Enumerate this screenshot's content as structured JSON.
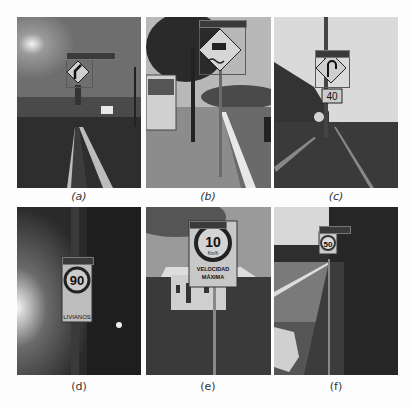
{
  "figure": {
    "panels": [
      {
        "id": "a",
        "caption": "(a)",
        "caption_style": "italic",
        "scene": "dusk highway with median, diamond junction sign"
      },
      {
        "id": "b",
        "caption": "(b)",
        "caption_style": "italic",
        "scene": "sunny sidewalk with trees, bus, diamond slippery-road sign"
      },
      {
        "id": "c",
        "caption": "(c)",
        "caption_style": "italic",
        "scene": "overcast road shoulder, diamond U-turn sign above speed sign",
        "speed_value": "40"
      },
      {
        "id": "d",
        "caption": "(d)",
        "caption_style": "normal",
        "scene": "night foggy street, speed limit sign",
        "speed_value": "90",
        "sign_text": "LIVIANOS"
      },
      {
        "id": "e",
        "caption": "(e)",
        "caption_style": "normal",
        "scene": "rural house on hillside, max speed sign",
        "speed_value": "10",
        "unit": "Km/h",
        "sign_text_1": "VELOCIDAD",
        "sign_text_2": "MÁXIMA"
      },
      {
        "id": "f",
        "caption": "(f)",
        "caption_style": "normal",
        "scene": "highway shoulder with vegetation, speed limit sign",
        "speed_value": "50"
      }
    ]
  }
}
